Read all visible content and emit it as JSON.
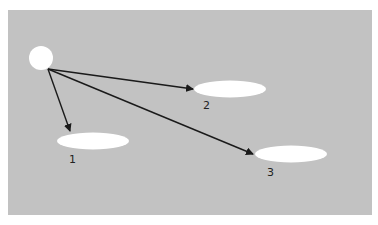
{
  "diagram": {
    "background_color": "#c2c2c2",
    "node_color": "#ffffff",
    "arrow_color": "#1a1a1a",
    "source": {
      "name": "origin",
      "cx": 41,
      "cy": 58,
      "r": 12
    },
    "targets": [
      {
        "label": "1",
        "cx": 93,
        "cy": 141,
        "rx": 36,
        "ry": 8,
        "label_x": 69,
        "label_y": 154
      },
      {
        "label": "2",
        "cx": 230,
        "cy": 89,
        "rx": 36,
        "ry": 8,
        "label_x": 203,
        "label_y": 100
      },
      {
        "label": "3",
        "cx": 291,
        "cy": 154,
        "rx": 36,
        "ry": 8,
        "label_x": 267,
        "label_y": 167
      }
    ],
    "arrows": [
      {
        "from": [
          48,
          69
        ],
        "to": [
          70,
          132
        ]
      },
      {
        "from": [
          48,
          69
        ],
        "to": [
          193,
          89
        ]
      },
      {
        "from": [
          48,
          69
        ],
        "to": [
          253,
          154
        ]
      }
    ]
  }
}
